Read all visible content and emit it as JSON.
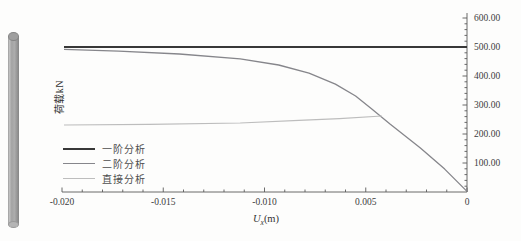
{
  "figure": {
    "background": "#fdfdfc",
    "model_image": "3d-cylindrical-column-render"
  },
  "chart_data": {
    "type": "line",
    "title": "",
    "xlabel": "Ux(m)",
    "xlabel_parts": {
      "base": "U",
      "sub": "x",
      "unit": "(m)"
    },
    "ylabel": "荷载kN",
    "xlim": [
      -0.02,
      0
    ],
    "ylim": [
      0,
      600
    ],
    "grid": false,
    "axis_side": "right",
    "axis_color": "#5a5a5a",
    "x_ticks": {
      "values": [
        -0.02,
        -0.015,
        -0.01,
        -0.005,
        0
      ],
      "labels": [
        "-0.020",
        "-0.015",
        "-0.010",
        "0.005",
        "0"
      ],
      "minor_step": 0.001
    },
    "y_ticks": {
      "values": [
        100,
        200,
        300,
        400,
        500,
        600
      ],
      "labels": [
        "100.00",
        "200.00",
        "300.00",
        "400.00",
        "500.00",
        "600.00"
      ],
      "minor_step": 20
    },
    "legend_position": "lower-left",
    "series": [
      {
        "name": "一阶分析",
        "color": "#383838",
        "stroke_width": 2.2,
        "points": [
          [
            -0.0199,
            500
          ],
          [
            0,
            500
          ]
        ]
      },
      {
        "name": "二阶分析",
        "color": "#86868b",
        "stroke_width": 1.3,
        "points": [
          [
            -0.0199,
            492
          ],
          [
            -0.0172,
            486
          ],
          [
            -0.0142,
            476
          ],
          [
            -0.0112,
            459
          ],
          [
            -0.0093,
            438
          ],
          [
            -0.0078,
            410
          ],
          [
            -0.0065,
            372
          ],
          [
            -0.0055,
            331
          ],
          [
            -0.0047,
            286
          ],
          [
            -0.0038,
            234
          ],
          [
            -0.0023,
            152
          ],
          [
            -0.0011,
            79
          ],
          [
            0,
            2
          ]
        ]
      },
      {
        "name": "直接分析",
        "color": "#bdbdbd",
        "stroke_width": 1.2,
        "points": [
          [
            -0.0199,
            231
          ],
          [
            -0.0157,
            233
          ],
          [
            -0.0112,
            238
          ],
          [
            -0.0083,
            247
          ],
          [
            -0.0063,
            253
          ],
          [
            -0.0042,
            262
          ]
        ]
      }
    ]
  }
}
